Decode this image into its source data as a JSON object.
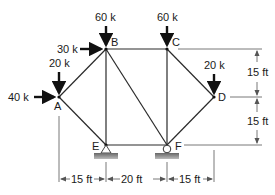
{
  "diagram": {
    "type": "planar-truss",
    "joints": {
      "A": {
        "label": "A"
      },
      "B": {
        "label": "B"
      },
      "C": {
        "label": "C"
      },
      "D": {
        "label": "D"
      },
      "E": {
        "label": "E"
      },
      "F": {
        "label": "F"
      }
    },
    "members": [
      "A-B",
      "A-E",
      "B-C",
      "B-E",
      "B-F",
      "C-F",
      "C-D",
      "D-F",
      "E-F"
    ],
    "loads": [
      {
        "joint": "B",
        "label": "60 k",
        "direction": "down"
      },
      {
        "joint": "B",
        "label": "30 k",
        "direction": "right"
      },
      {
        "joint": "C",
        "label": "60 k",
        "direction": "down"
      },
      {
        "joint": "A",
        "label": "20 k",
        "direction": "down"
      },
      {
        "joint": "A",
        "label": "40 k",
        "direction": "right"
      },
      {
        "joint": "D",
        "label": "20 k",
        "direction": "down"
      }
    ],
    "supports": [
      {
        "joint": "E",
        "type": "pin"
      },
      {
        "joint": "F",
        "type": "roller"
      }
    ],
    "dimensions": {
      "horizontal": [
        "15 ft",
        "20 ft",
        "15 ft"
      ],
      "vertical": [
        "15 ft",
        "15 ft"
      ]
    }
  }
}
